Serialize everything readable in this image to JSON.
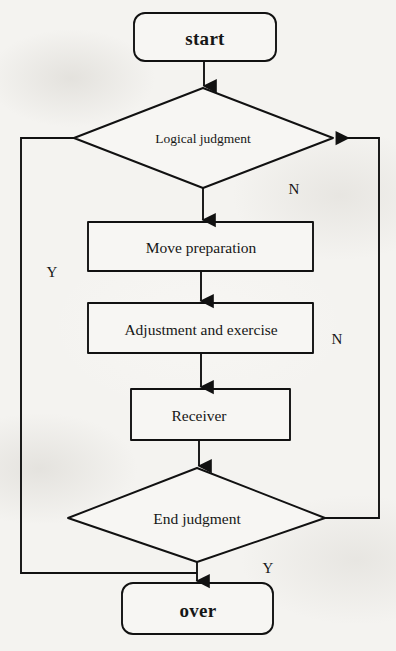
{
  "diagram": {
    "type": "flowchart",
    "orientation": "top-to-bottom",
    "stroke_color": "#111111",
    "fill_color": "#f7f6f3",
    "background_color": "#f4f3f0",
    "nodes": [
      {
        "id": "start",
        "shape": "terminal",
        "label": "start"
      },
      {
        "id": "logical",
        "shape": "decision",
        "label": "Logical judgment"
      },
      {
        "id": "move",
        "shape": "process",
        "label": "Move preparation"
      },
      {
        "id": "adjustment",
        "shape": "process",
        "label": "Adjustment and exercise"
      },
      {
        "id": "receiver",
        "shape": "process",
        "label": "Receiver"
      },
      {
        "id": "endjudge",
        "shape": "decision",
        "label": "End judgment"
      },
      {
        "id": "over",
        "shape": "terminal",
        "label": "over"
      }
    ],
    "edges": [
      {
        "from": "start",
        "to": "logical",
        "label": "",
        "arrow": true
      },
      {
        "from": "logical",
        "to": "move",
        "label": "",
        "arrow": true
      },
      {
        "from": "move",
        "to": "adjustment",
        "label": "",
        "arrow": true
      },
      {
        "from": "adjustment",
        "to": "receiver",
        "label": "",
        "arrow": true
      },
      {
        "from": "receiver",
        "to": "endjudge",
        "label": "",
        "arrow": true
      },
      {
        "from": "endjudge",
        "to": "over",
        "label": "Y",
        "arrow": true
      },
      {
        "from": "endjudge",
        "to": "logical",
        "label": "N",
        "arrow": true
      },
      {
        "from": "logical",
        "to": "over",
        "label": "Y",
        "arrow": true
      }
    ],
    "edge_labels": {
      "logical_no": "N",
      "loop_no": "N",
      "logical_yes": "Y",
      "end_yes": "Y"
    }
  }
}
